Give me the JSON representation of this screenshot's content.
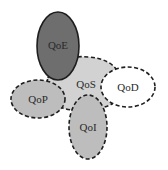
{
  "diagram": {
    "title": "",
    "nodes": [
      {
        "id": "qos",
        "label": "QoS",
        "fill": "#d2d2d2",
        "border": "dashed"
      },
      {
        "id": "qoe",
        "label": "QoE",
        "fill": "#6e6e6e",
        "border": "solid"
      },
      {
        "id": "qod",
        "label": "QoD",
        "fill": "#ffffff",
        "border": "dashed"
      },
      {
        "id": "qop",
        "label": "QoP",
        "fill": "#bdbdbd",
        "border": "dashed"
      },
      {
        "id": "qoi",
        "label": "QoI",
        "fill": "#bdbdbd",
        "border": "dashed"
      }
    ],
    "colors": {
      "stroke": "#1e1e1e",
      "background": "#ffffff"
    }
  }
}
